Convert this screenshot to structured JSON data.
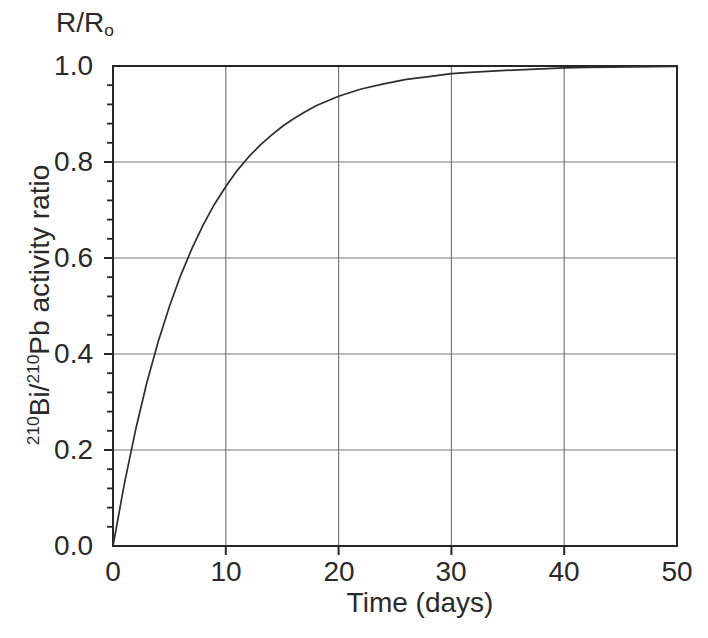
{
  "figure": {
    "ratio_label": {
      "base": "R/R",
      "sub": "o"
    },
    "x_axis_title": "Time (days)",
    "y_axis_title": {
      "sup1": "210",
      "t1": "Bi/",
      "sup2": "210",
      "t2": "Pb activity ratio"
    }
  },
  "chart_data": {
    "type": "line",
    "title": "",
    "top_left_label": "R/Ro",
    "xlabel": "Time (days)",
    "ylabel": "210Bi/210Pb activity ratio",
    "xlim": [
      0,
      50
    ],
    "ylim": [
      0,
      1
    ],
    "x_ticks": [
      0,
      10,
      20,
      30,
      40,
      50
    ],
    "x_tick_labels": [
      "0",
      "10",
      "20",
      "30",
      "40",
      "50"
    ],
    "y_ticks": [
      0,
      0.2,
      0.4,
      0.6,
      0.8,
      1.0
    ],
    "y_tick_labels": [
      "1.0",
      "0.8",
      "0.6",
      "0.4",
      "0.2",
      "0.0"
    ],
    "y_minor_tick_step": 0.04,
    "grid": true,
    "legend": "none",
    "colors": {
      "curve": "#2e2e2e",
      "grid": "#7a7a7a",
      "axis": "#262626",
      "text": "#2a2a2a",
      "background": "#ffffff"
    },
    "series": [
      {
        "name": "210Bi/210Pb ingrowth",
        "model": "R/R0 = 1 - exp(-ln2 * t / 5.01)",
        "half_life_days": 5.01,
        "points": [
          [
            0,
            0
          ],
          [
            1,
            0.129
          ],
          [
            2,
            0.242
          ],
          [
            3,
            0.34
          ],
          [
            4,
            0.425
          ],
          [
            5,
            0.499
          ],
          [
            6,
            0.564
          ],
          [
            7,
            0.62
          ],
          [
            8,
            0.669
          ],
          [
            9,
            0.712
          ],
          [
            10,
            0.749
          ],
          [
            11,
            0.782
          ],
          [
            12,
            0.81
          ],
          [
            13,
            0.834
          ],
          [
            14,
            0.855
          ],
          [
            15,
            0.874
          ],
          [
            16,
            0.89
          ],
          [
            17,
            0.904
          ],
          [
            18,
            0.917
          ],
          [
            19,
            0.927
          ],
          [
            20,
            0.937
          ],
          [
            22,
            0.952
          ],
          [
            24,
            0.963
          ],
          [
            26,
            0.972
          ],
          [
            28,
            0.978
          ],
          [
            30,
            0.984
          ],
          [
            32,
            0.987
          ],
          [
            34,
            0.99
          ],
          [
            36,
            0.992
          ],
          [
            38,
            0.994
          ],
          [
            40,
            0.996
          ],
          [
            42,
            0.997
          ],
          [
            44,
            0.9975
          ],
          [
            46,
            0.998
          ],
          [
            48,
            0.9985
          ],
          [
            50,
            0.999
          ]
        ]
      }
    ]
  }
}
